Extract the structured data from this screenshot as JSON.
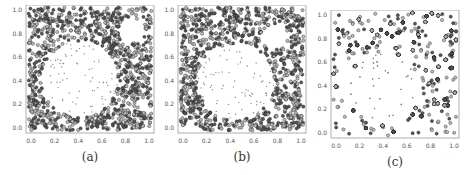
{
  "chart_data": [
    {
      "type": "scatter",
      "title": "",
      "caption": "(a)",
      "xlabel": "",
      "ylabel": "",
      "xlim": [
        0.0,
        1.0
      ],
      "ylim": [
        0.0,
        1.0
      ],
      "xticks": [
        "0.0",
        "0.2",
        "0.4",
        "0.6",
        "0.8",
        "1.0"
      ],
      "yticks": [
        "0.0",
        "0.2",
        "0.4",
        "0.6",
        "0.8",
        "1.0"
      ],
      "grid": false,
      "description": "Dense dark circle markers fill the unit square except a large circular void centered near (0.4, 0.4) radius ~0.3 containing sparse small points, and a smaller void near (0.8, 0.8).",
      "series": [
        {
          "name": "outer dense points",
          "marker": "circle",
          "color": "#333333"
        },
        {
          "name": "inner sparse points",
          "marker": "dot",
          "color": "#777777"
        }
      ],
      "voids": [
        {
          "cx": 0.42,
          "cy": 0.42,
          "r": 0.3
        },
        {
          "cx": 0.82,
          "cy": 0.8,
          "r": 0.1
        }
      ]
    },
    {
      "type": "scatter",
      "title": "",
      "caption": "(b)",
      "xlim": [
        0.0,
        1.0
      ],
      "ylim": [
        0.0,
        1.0
      ],
      "xticks": [
        "0.0",
        "0.2",
        "0.4",
        "0.6",
        "0.8",
        "1.0"
      ],
      "yticks": [
        "0.0",
        "0.2",
        "0.4",
        "0.6",
        "0.8",
        "1.0"
      ],
      "grid": false,
      "description": "Similar pattern to (a) with a large circular void near (0.45, 0.4) and a smaller void near (0.75, 0.75).",
      "voids": [
        {
          "cx": 0.45,
          "cy": 0.4,
          "r": 0.3
        },
        {
          "cx": 0.75,
          "cy": 0.75,
          "r": 0.1
        }
      ]
    },
    {
      "type": "scatter",
      "title": "",
      "caption": "(c)",
      "xlim": [
        0.0,
        1.0
      ],
      "ylim": [
        0.0,
        1.0
      ],
      "xticks": [
        "0.0",
        "0.2",
        "0.4",
        "0.6",
        "0.8",
        "1.0"
      ],
      "yticks": [
        "0.0",
        "0.2",
        "0.4",
        "0.6",
        "0.8",
        "1.0"
      ],
      "grid": false,
      "description": "Similar pattern with a large circular void near (0.42, 0.38) and a small void near (0.8, 0.85).",
      "voids": [
        {
          "cx": 0.42,
          "cy": 0.38,
          "r": 0.28
        },
        {
          "cx": 0.82,
          "cy": 0.85,
          "r": 0.08
        }
      ]
    }
  ],
  "panels": [
    {
      "caption": "(a)",
      "left": 26,
      "top": 5,
      "size": 128,
      "seed": 11
    },
    {
      "caption": "(b)",
      "left": 178,
      "top": 5,
      "size": 128,
      "seed": 23
    },
    {
      "caption": "(c)",
      "left": 331,
      "top": 10,
      "size": 128,
      "seed": 37
    }
  ]
}
